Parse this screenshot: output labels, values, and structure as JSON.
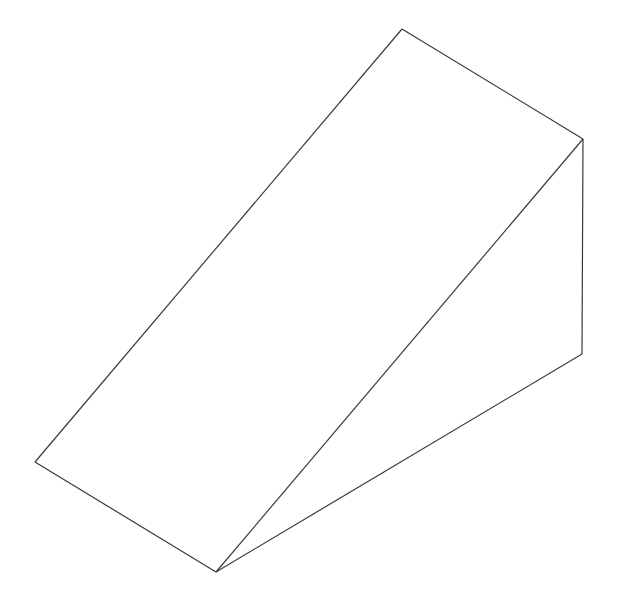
{
  "diagram": {
    "type": "wireframe-wedge",
    "stroke_color": "#3a3a3a",
    "background": "#ffffff",
    "vertices": {
      "top": [
        402,
        29
      ],
      "right_top": [
        583,
        139
      ],
      "right_bottom": [
        582,
        354
      ],
      "left": [
        35,
        462
      ],
      "bottom": [
        216,
        572
      ]
    },
    "edges": [
      [
        "left",
        "top"
      ],
      [
        "top",
        "right_top"
      ],
      [
        "right_top",
        "right_bottom"
      ],
      [
        "right_bottom",
        "bottom"
      ],
      [
        "bottom",
        "left"
      ],
      [
        "bottom",
        "right_top"
      ]
    ]
  }
}
